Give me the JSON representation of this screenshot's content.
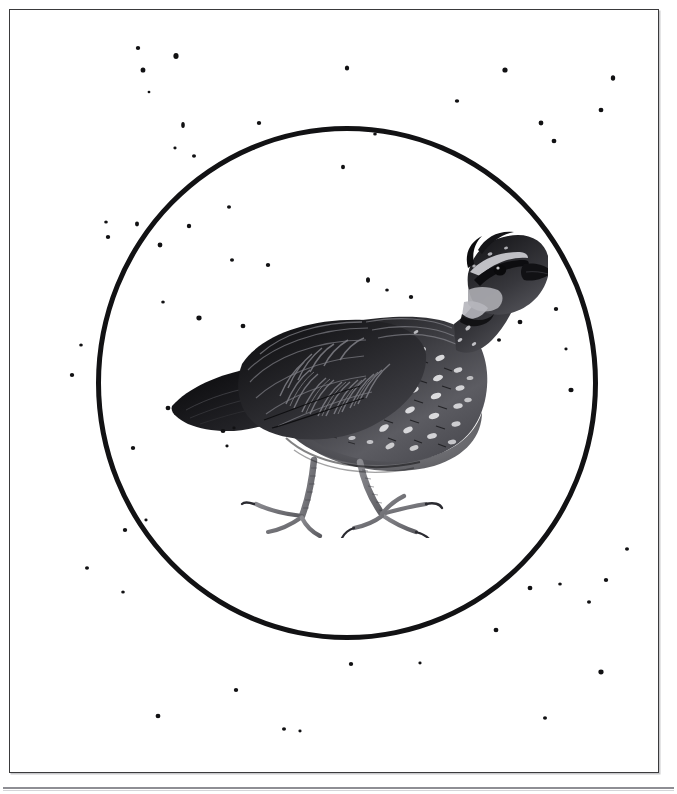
{
  "page": {
    "background_color": "#ffffff",
    "width": 677,
    "height": 794,
    "kind": "scanned-book-plate",
    "caption": ""
  },
  "frame": {
    "border_color": "#3a3a3c",
    "shadow_color": "#c9c9cc",
    "left": 9,
    "top": 9,
    "width": 648,
    "height": 762
  },
  "bottom_rule": {
    "color": "#8e8e94",
    "secondary_color": "#d4d4d8",
    "top": 787
  },
  "circle": {
    "stroke_color": "#121214",
    "stroke_width": 5.5,
    "center_x": 347,
    "center_y": 383,
    "radius_x": 251,
    "radius_y": 257
  },
  "illustration": {
    "subject": "northern-bobwhite-quail",
    "style": "grayscale engraving / halftone",
    "pose": "standing, facing right",
    "left": 168,
    "top": 228,
    "width": 380,
    "height": 310,
    "palette": {
      "darkest": "#0d0d0f",
      "dark": "#2a2a2d",
      "mid": "#55555a",
      "light_mid": "#8e8e93",
      "light": "#c2c2c6",
      "highlight": "#f2f2f4"
    },
    "parts": [
      "crest",
      "eye-stripe",
      "throat-patch",
      "bill",
      "eye",
      "nape",
      "mantle",
      "wing-coverts",
      "primaries",
      "tail",
      "breast",
      "flank-spots",
      "belly",
      "legs",
      "feet"
    ]
  },
  "specks": {
    "color": "#111113",
    "count": 58,
    "description": "scattered irregular ink specks across the plate"
  }
}
